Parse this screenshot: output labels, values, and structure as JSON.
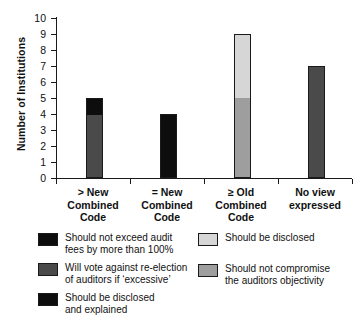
{
  "chart_data": {
    "type": "bar",
    "stacked": true,
    "title": "",
    "xlabel": "",
    "ylabel": "Number of Institutions",
    "ylim": [
      0,
      10
    ],
    "ytick_step": 1,
    "yticks": [
      "10",
      "9",
      "8",
      "7",
      "6",
      "5",
      "4",
      "3",
      "2",
      "1",
      "0"
    ],
    "grid": false,
    "legend_position": "below",
    "categories": [
      "> New\nCombined\nCode",
      "= New\nCombined\nCode",
      "≥ Old\nCombined\nCode",
      "No view\nexpressed"
    ],
    "category_lines": [
      [
        "> New",
        "Combined",
        "Code"
      ],
      [
        "= New",
        "Combined",
        "Code"
      ],
      [
        "≥ Old",
        "Combined",
        "Code"
      ],
      [
        "No view",
        "expressed"
      ]
    ],
    "series": [
      {
        "name": "Should not exceed audit fees by more than 100%",
        "color": "#0d0d0d",
        "values": [
          1,
          0,
          0,
          0
        ]
      },
      {
        "name": "Will vote against re-election of auditors if 'excessive'",
        "color": "#4a4a4a",
        "values": [
          4,
          0,
          0,
          7
        ]
      },
      {
        "name": "Should be disclosed and explained",
        "color": "#0d0d0d",
        "values": [
          0,
          4,
          0,
          0
        ]
      },
      {
        "name": "Should be disclosed",
        "color": "#d6d6d6",
        "values": [
          0,
          0,
          4,
          0
        ]
      },
      {
        "name": "Should not compromise the auditors objectivity",
        "color": "#9e9e9e",
        "values": [
          0,
          0,
          5,
          0
        ]
      }
    ],
    "bars": [
      {
        "category": "> New Combined Code",
        "total": 5,
        "segments": [
          {
            "label": "Will vote against re-election of auditors if 'excessive'",
            "value": 4,
            "color": "#4a4a4a"
          },
          {
            "label": "Should not exceed audit fees by more than 100%",
            "value": 1,
            "color": "#0d0d0d"
          }
        ]
      },
      {
        "category": "= New Combined Code",
        "total": 4,
        "segments": [
          {
            "label": "Should be disclosed and explained",
            "value": 4,
            "color": "#0d0d0d"
          }
        ]
      },
      {
        "category": "≥ Old Combined Code",
        "total": 9,
        "segments": [
          {
            "label": "Should not compromise the auditors objectivity",
            "value": 5,
            "color": "#9e9e9e"
          },
          {
            "label": "Should be disclosed",
            "value": 4,
            "color": "#d6d6d6"
          }
        ]
      },
      {
        "category": "No view expressed",
        "total": 7,
        "segments": [
          {
            "label": "Will vote against re-election of auditors if 'excessive'",
            "value": 7,
            "color": "#4a4a4a"
          }
        ]
      }
    ]
  },
  "legend": {
    "left": [
      {
        "color": "#0d0d0d",
        "lines": [
          "Should not exceed audit",
          "fees by more than 100%"
        ]
      },
      {
        "color": "#4a4a4a",
        "lines": [
          "Will vote against re-election",
          "of auditors if ‘excessive’"
        ]
      },
      {
        "color": "#0d0d0d",
        "lines": [
          "Should be disclosed",
          "and explained"
        ]
      }
    ],
    "right": [
      {
        "color": "#d6d6d6",
        "lines": [
          "Should be disclosed"
        ]
      },
      {
        "color": "#9e9e9e",
        "lines": [
          "Should not compromise",
          "the auditors objectivity"
        ]
      }
    ]
  }
}
